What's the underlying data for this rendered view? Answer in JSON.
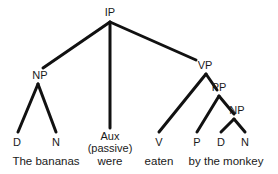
{
  "figure": {
    "kind": "syntax-tree",
    "sentence": "The bananas were eaten by the monkey",
    "background_color": "#ffffff",
    "line_color": "#111111",
    "text_color": "#1a1a1a"
  },
  "nodes": {
    "ip": "IP",
    "np_subject": "NP",
    "vp": "VP",
    "pp": "PP",
    "np_object": "NP"
  },
  "terminals": {
    "d_subject": "D",
    "n_subject": "N",
    "aux": "Aux",
    "aux_feature": "(passive)",
    "v": "V",
    "p": "P",
    "d_object": "D",
    "n_object": "N"
  },
  "words": {
    "subject_phrase": "The bananas",
    "aux_word": "were",
    "verb_word": "eaten",
    "pp_phrase": "by the monkey"
  }
}
